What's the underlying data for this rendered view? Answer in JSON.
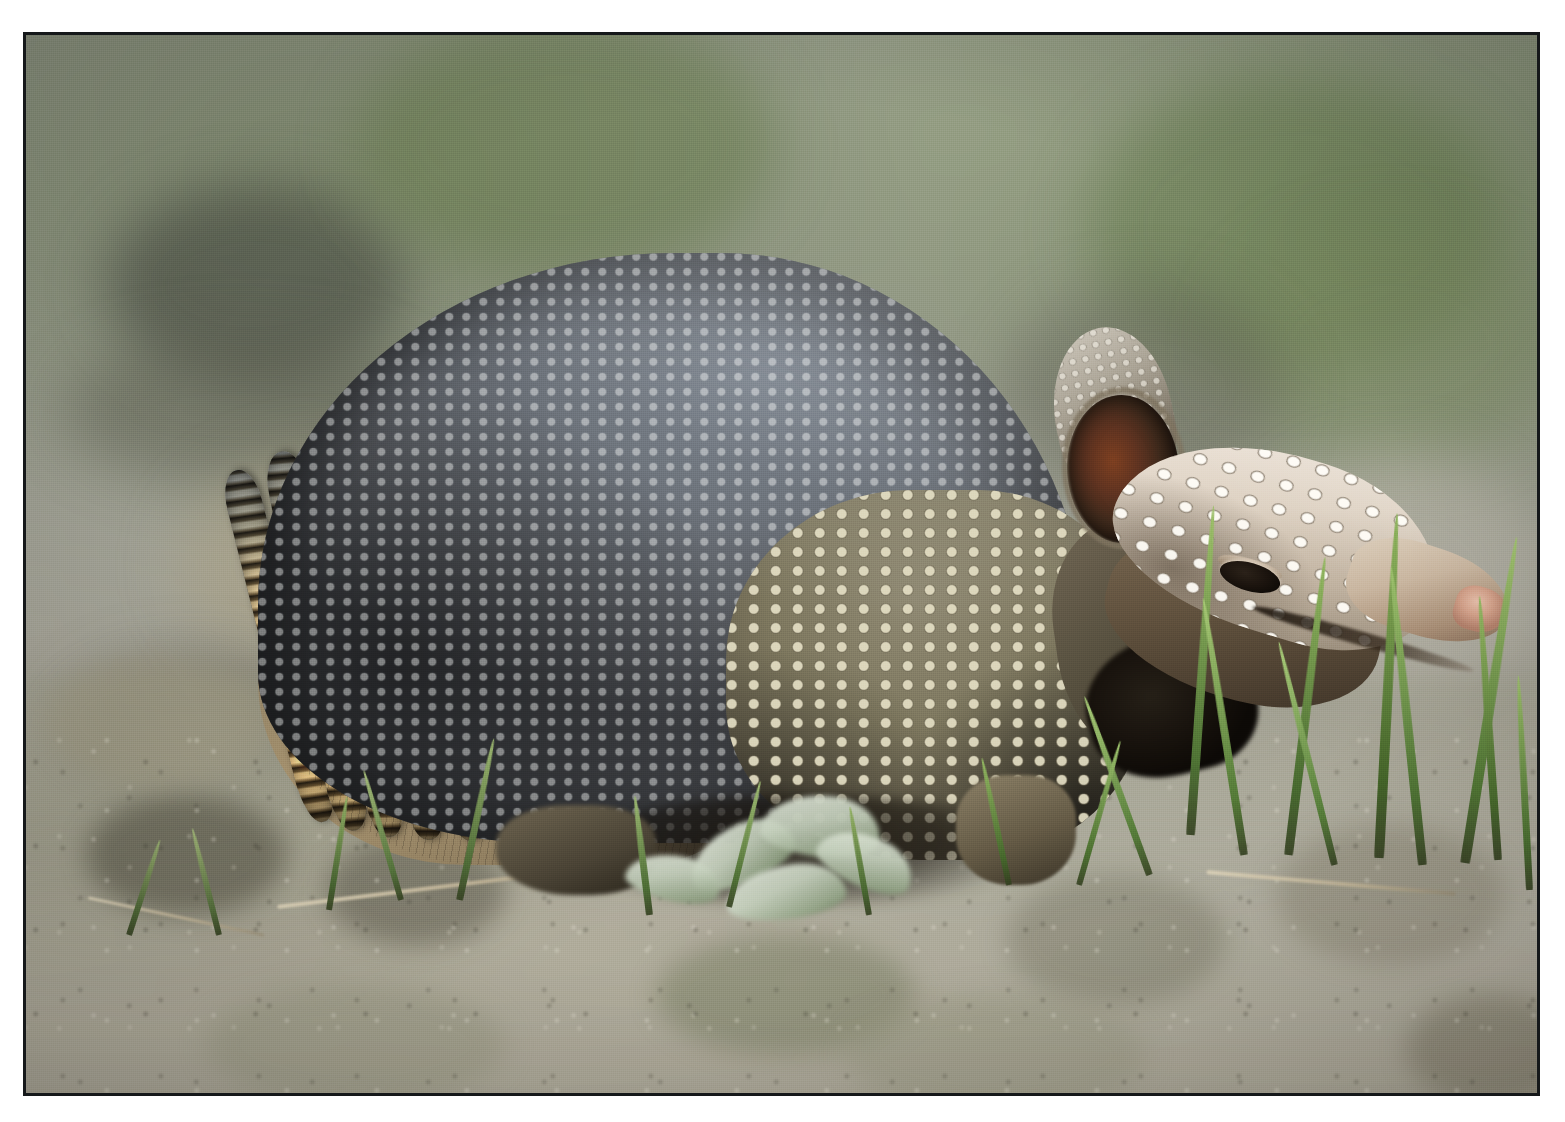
{
  "photo": {
    "subject": "nine-banded armadillo",
    "scene_description": "A nine-banded armadillo walking on bare dirt ground with sparse green grass, photographed in profile facing right against a soft blurred green-grey background.",
    "orientation": "landscape",
    "frame": {
      "border_color": "#15181a",
      "mat_color": "#ffffff"
    },
    "palette": {
      "background_green": "#7a8568",
      "background_grey": "#9b9d90",
      "ground_tan": "#aeaa96",
      "carapace_grey": "#6d737b",
      "band_tan": "#a7936f",
      "band_dark": "#2f2a20",
      "head_scale_cream": "#e4d9cb",
      "ear_inner_rust": "#7d3f20",
      "snout_pink": "#d4a28b",
      "grass_green": "#7fa356",
      "scute_highlight": "#e8e6dc"
    },
    "subject_parts": [
      {
        "name": "carapace-dome",
        "label": "Pelvic and scapular shields (grey pebbled armor)"
      },
      {
        "name": "banded-section",
        "label": "Nine movable bands across the mid-back"
      },
      {
        "name": "belly-shield",
        "label": "Flank scutes (tan pebbled plates)"
      },
      {
        "name": "head-shield",
        "label": "Scaly cream-coloured head shield"
      },
      {
        "name": "ear-back",
        "label": "Rear ear, pale and warty"
      },
      {
        "name": "ear-front",
        "label": "Forward ear with rust-brown inner surface"
      },
      {
        "name": "eye",
        "label": "Closed dark eye"
      },
      {
        "name": "snout",
        "label": "Long tapering snout"
      },
      {
        "name": "snout-tip",
        "label": "Pink nose tip"
      },
      {
        "name": "front-leg",
        "label": "Foreleg tucked beneath the body"
      },
      {
        "name": "rear-leg",
        "label": "Hind leg partly hidden by grass"
      }
    ],
    "background_elements": [
      {
        "name": "blurred-foliage",
        "label": "Out-of-focus green vegetation"
      },
      {
        "name": "dark-blur-patch",
        "label": "Dark out-of-focus mass at upper left"
      },
      {
        "name": "dirt-ground",
        "label": "Pale brown dirt and pebbles"
      },
      {
        "name": "grass-clump-right",
        "label": "Tall green grass blades at right"
      },
      {
        "name": "pale-leaf-cluster",
        "label": "Pale grey-green leaf cluster in the foreground"
      },
      {
        "name": "dry-stem",
        "label": "Thin dry stem crossing the lower left ground"
      }
    ],
    "bands": [
      {
        "x": 236,
        "y": 430,
        "w": 36,
        "h": 362,
        "rot": -14
      },
      {
        "x": 272,
        "y": 413,
        "w": 40,
        "h": 386,
        "rot": -11
      },
      {
        "x": 315,
        "y": 400,
        "w": 42,
        "h": 404,
        "rot": -8
      },
      {
        "x": 360,
        "y": 390,
        "w": 44,
        "h": 416,
        "rot": -6
      },
      {
        "x": 408,
        "y": 382,
        "w": 46,
        "h": 424,
        "rot": -4
      },
      {
        "x": 458,
        "y": 378,
        "w": 48,
        "h": 428,
        "rot": -2
      },
      {
        "x": 510,
        "y": 376,
        "w": 50,
        "h": 430,
        "rot": 0
      },
      {
        "x": 564,
        "y": 378,
        "w": 52,
        "h": 428,
        "rot": 2
      },
      {
        "x": 620,
        "y": 384,
        "w": 54,
        "h": 420,
        "rot": 4
      }
    ],
    "grass_blades": [
      {
        "x": 1160,
        "y": 470,
        "w": 9,
        "h": 330,
        "rot": 4,
        "color1": "#9ec16a",
        "color2": "#4e7234"
      },
      {
        "x": 1214,
        "y": 560,
        "w": 8,
        "h": 260,
        "rot": -9,
        "color1": "#a6c874",
        "color2": "#547a37"
      },
      {
        "x": 1258,
        "y": 520,
        "w": 9,
        "h": 300,
        "rot": 7,
        "color1": "#93b861",
        "color2": "#47692f"
      },
      {
        "x": 1305,
        "y": 600,
        "w": 7,
        "h": 230,
        "rot": -14,
        "color1": "#a9cb79",
        "color2": "#557c39"
      },
      {
        "x": 1348,
        "y": 478,
        "w": 10,
        "h": 345,
        "rot": 3,
        "color1": "#8fb55e",
        "color2": "#446429"
      },
      {
        "x": 1392,
        "y": 530,
        "w": 9,
        "h": 300,
        "rot": -6,
        "color1": "#9cc06c",
        "color2": "#4d7133"
      },
      {
        "x": 1434,
        "y": 498,
        "w": 10,
        "h": 330,
        "rot": 9,
        "color1": "#a2c470",
        "color2": "#507534"
      },
      {
        "x": 1468,
        "y": 560,
        "w": 8,
        "h": 265,
        "rot": -4,
        "color1": "#96ba64",
        "color2": "#486a2d"
      },
      {
        "x": 1120,
        "y": 650,
        "w": 7,
        "h": 190,
        "rot": -20,
        "color1": "#a8cb77",
        "color2": "#547a38"
      },
      {
        "x": 1050,
        "y": 700,
        "w": 6,
        "h": 150,
        "rot": 16,
        "color1": "#9dc26d",
        "color2": "#4c7030"
      },
      {
        "x": 980,
        "y": 720,
        "w": 6,
        "h": 130,
        "rot": -12,
        "color1": "#93b862",
        "color2": "#46682c"
      },
      {
        "x": 430,
        "y": 700,
        "w": 7,
        "h": 165,
        "rot": 12,
        "color1": "#9ab46f",
        "color2": "#4d6a36"
      },
      {
        "x": 372,
        "y": 730,
        "w": 6,
        "h": 135,
        "rot": -16,
        "color1": "#a3bb79",
        "color2": "#52703a"
      },
      {
        "x": 300,
        "y": 760,
        "w": 6,
        "h": 115,
        "rot": 9,
        "color1": "#8fad63",
        "color2": "#466230"
      },
      {
        "x": 620,
        "y": 760,
        "w": 7,
        "h": 120,
        "rot": -7,
        "color1": "#9cb872",
        "color2": "#4c6c34"
      },
      {
        "x": 700,
        "y": 742,
        "w": 6,
        "h": 130,
        "rot": 14,
        "color1": "#a0bd74",
        "color2": "#4f7035"
      },
      {
        "x": 840,
        "y": 770,
        "w": 6,
        "h": 110,
        "rot": -10,
        "color1": "#94b266",
        "color2": "#476630"
      },
      {
        "x": 1500,
        "y": 640,
        "w": 7,
        "h": 215,
        "rot": -3,
        "color1": "#9dc16b",
        "color2": "#4b7031"
      },
      {
        "x": 100,
        "y": 800,
        "w": 6,
        "h": 100,
        "rot": 18,
        "color1": "#96ac6f",
        "color2": "#4a6233"
      },
      {
        "x": 190,
        "y": 790,
        "w": 6,
        "h": 110,
        "rot": -14,
        "color1": "#a0b478",
        "color2": "#516a39"
      }
    ],
    "leaf_cluster": [
      {
        "x": 660,
        "y": 790,
        "w": 110,
        "h": 58,
        "rot": -22
      },
      {
        "x": 735,
        "y": 760,
        "w": 120,
        "h": 62,
        "rot": 8
      },
      {
        "x": 790,
        "y": 800,
        "w": 100,
        "h": 52,
        "rot": 26
      },
      {
        "x": 700,
        "y": 830,
        "w": 120,
        "h": 54,
        "rot": -6
      },
      {
        "x": 600,
        "y": 820,
        "w": 95,
        "h": 46,
        "rot": 14
      }
    ],
    "dry_stems": [
      {
        "x": 250,
        "y": 848,
        "w": 360,
        "h": 4,
        "rot": -7
      },
      {
        "x": 1180,
        "y": 846,
        "w": 250,
        "h": 4,
        "rot": 5
      },
      {
        "x": 60,
        "y": 880,
        "w": 180,
        "h": 3,
        "rot": 12
      }
    ]
  }
}
